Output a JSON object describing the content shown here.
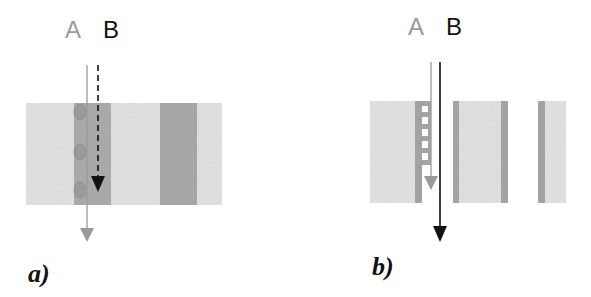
{
  "panels": [
    {
      "id": "a",
      "caption": "a)",
      "labels": {
        "a": "A",
        "b": "B"
      },
      "arrow_a": {
        "style": "solid",
        "color": "#9a9a9a"
      },
      "arrow_b": {
        "style": "dashed",
        "color": "#111111"
      }
    },
    {
      "id": "b",
      "caption": "b)",
      "labels": {
        "a": "A",
        "b": "B"
      },
      "arrow_a": {
        "style": "solid",
        "color": "#9a9a9a"
      },
      "arrow_b": {
        "style": "solid",
        "color": "#111111"
      }
    }
  ],
  "colors": {
    "light_layer": "#e2e2e2",
    "dark_layer": "#a6a6a6",
    "label_a": "#9a9a9a",
    "label_b": "#111111"
  }
}
